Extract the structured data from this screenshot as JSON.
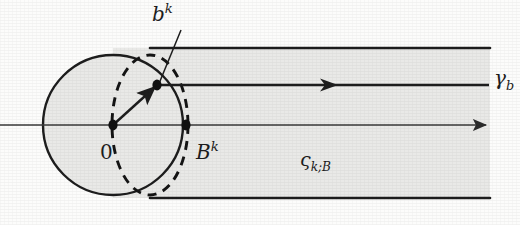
{
  "figure": {
    "kind": "mathematical-diagram",
    "caption_absent": true,
    "canvas": {
      "width": 520,
      "height": 225
    },
    "colors": {
      "paper": "#fcfcfb",
      "region_fill": "#e9e9e7",
      "ink": "#1d1d1d",
      "axis_ink": "#3a3a3a"
    }
  },
  "labels": {
    "b_superscript_k": {
      "base": "b",
      "sup": "k"
    },
    "origin": {
      "base": "0"
    },
    "B_superscript_k": {
      "base": "B",
      "sup": "k"
    },
    "region_zeta": {
      "base": "ς",
      "sub": "k;B"
    },
    "gamma_b": {
      "base": "γ",
      "sub": "b"
    }
  },
  "geometry": {
    "cap_circle": {
      "cx": 113,
      "cy": 125,
      "r": 70
    },
    "band": {
      "top_y": 48,
      "bottom_y": 198,
      "right_x": 490
    },
    "dashed_ellipse": {
      "cx": 150,
      "cy": 125,
      "rx": 38,
      "ry": 70
    },
    "axis_line": {
      "y": 125,
      "x_start": 0,
      "x_end": 487,
      "arrow_at_x": 487
    },
    "middle_ray": {
      "y": 85,
      "x_start": 155,
      "x_end": 488,
      "arrow_at_x": 336
    },
    "points": [
      {
        "name": "origin-point",
        "x": 113,
        "y": 125
      },
      {
        "name": "Bk-point",
        "x": 186,
        "y": 125
      },
      {
        "name": "bk-point",
        "x": 157,
        "y": 85
      }
    ],
    "short_arrow": {
      "x1": 113,
      "y1": 125,
      "x2": 157,
      "y2": 85
    },
    "leader_line": {
      "x1": 181,
      "y1": 30,
      "x2": 158,
      "y2": 86
    }
  }
}
